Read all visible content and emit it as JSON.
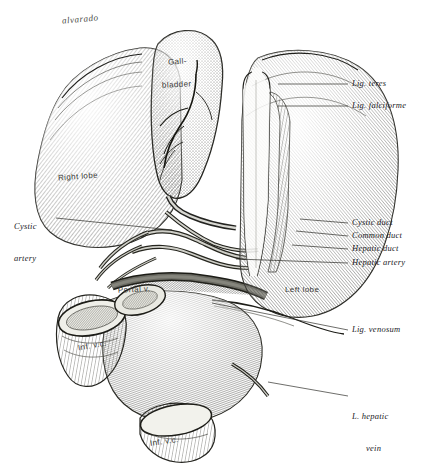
{
  "figure": {
    "signature": "alvarado",
    "background_color": "#ffffff",
    "ink_color": "#20201e"
  },
  "labels": {
    "right_column": [
      {
        "id": "lig-teres",
        "text": "Lig. teres",
        "x": 352,
        "y": 80,
        "leader_from_x": 348,
        "leader_to_x": 278,
        "leader_y": 84
      },
      {
        "id": "lig-falciforme",
        "text": "Lig. falciforme",
        "x": 352,
        "y": 102,
        "leader_from_x": 348,
        "leader_to_x": 278,
        "leader_y": 106
      },
      {
        "id": "cystic-duct",
        "text": "Cystic duct",
        "x": 352,
        "y": 219,
        "leader_from_x": 348,
        "leader_to_x": 300,
        "leader_y": 223
      },
      {
        "id": "common-duct",
        "text": "Common duct",
        "x": 352,
        "y": 232,
        "leader_from_x": 348,
        "leader_to_x": 296,
        "leader_y": 236
      },
      {
        "id": "hepatic-duct",
        "text": "Hepatic duct",
        "x": 352,
        "y": 245,
        "leader_from_x": 348,
        "leader_to_x": 292,
        "leader_y": 249
      },
      {
        "id": "hepatic-artery",
        "text": "Hepatic artery",
        "x": 352,
        "y": 259,
        "leader_from_x": 348,
        "leader_to_x": 236,
        "leader_y": 263
      },
      {
        "id": "lig-venosum",
        "text": "Lig. venosum",
        "x": 352,
        "y": 326,
        "leader_from_x": 348,
        "leader_to_x": 212,
        "leader_y": 330
      }
    ],
    "right_multiline": [
      {
        "id": "l-hepatic-vein",
        "line1": "L. hepatic",
        "line2": "vein",
        "x": 352,
        "y": 392,
        "leader_from_x": 348,
        "leader_to_x": 268,
        "leader_y": 396
      }
    ],
    "left_multiline": [
      {
        "id": "cystic-artery",
        "line1": "Cystic",
        "line2": "artery",
        "x": 14,
        "y": 206,
        "leader_from_x": 56,
        "leader_to_x": 170,
        "leader_y": 218
      }
    ],
    "on_figure": [
      {
        "id": "gall-bladder-1",
        "text": "Gall-",
        "x": 168,
        "y": 57
      },
      {
        "id": "gall-bladder-2",
        "text": "bladder",
        "x": 162,
        "y": 80
      },
      {
        "id": "right-lobe",
        "text": "Right lobe",
        "x": 58,
        "y": 172
      },
      {
        "id": "left-lobe",
        "text": "Left lobe",
        "x": 285,
        "y": 285
      },
      {
        "id": "portal-v",
        "text": "Portal v.",
        "x": 118,
        "y": 285
      },
      {
        "id": "inf-vc-upper",
        "text": "Inf. v.c.",
        "x": 78,
        "y": 341
      },
      {
        "id": "inf-vc-lower",
        "text": "Inf. v.c.",
        "x": 150,
        "y": 437
      }
    ],
    "signature_pos": {
      "x": 62,
      "y": 14
    }
  }
}
